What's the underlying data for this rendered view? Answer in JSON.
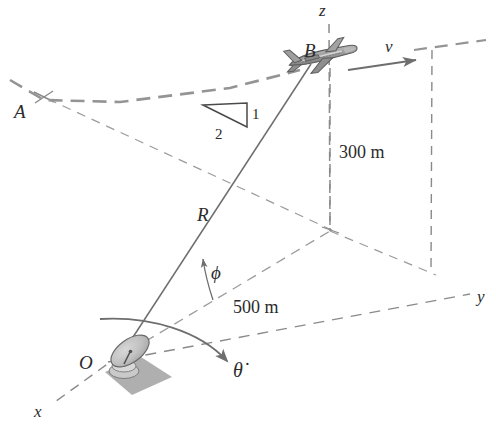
{
  "figure": {
    "kind": "engineering-kinematics-diagram",
    "background_color": "#ffffff",
    "ink_color": "#2b2b2b",
    "dash_color": "#8a8a8a",
    "solid_line_color": "#6e6e6e",
    "plane_fill": "#9a9a9a",
    "plane_stroke": "#5d5d5d",
    "dish_fill": "#bdbdbd",
    "dish_stroke": "#6a6a6a",
    "shadow_fill": "#a8a8a8"
  },
  "axes": {
    "z": {
      "label": "z",
      "x": 322,
      "y": 14
    },
    "y": {
      "label": "y",
      "x": 481,
      "y": 299
    },
    "x": {
      "label": "x",
      "x": 41,
      "y": 414
    }
  },
  "points": {
    "origin": {
      "label": "O",
      "x": 87,
      "y": 362,
      "description": "radar station at origin"
    },
    "aircraft": {
      "label": "B",
      "x": 311,
      "y": 50,
      "description": "aircraft current position"
    },
    "path_point": {
      "label": "A",
      "x": 23,
      "y": 111,
      "description": "point A on flight path"
    }
  },
  "vectors": {
    "range": {
      "label": "R",
      "x": 205,
      "y": 214,
      "description": "slant range from O to B"
    },
    "velocity": {
      "label": "v",
      "x": 391,
      "y": 48,
      "description": "aircraft velocity along flight path"
    }
  },
  "angles": {
    "elevation": {
      "label": "ϕ",
      "x": 218,
      "y": 272,
      "description": "elevation angle phi between R and horizontal"
    },
    "azimuth_rate": {
      "label": "θ̇",
      "x": 240,
      "y": 370,
      "description": "azimuth angular rate theta-dot"
    }
  },
  "dimensions": [
    {
      "id": "height",
      "label": "300 m",
      "x": 343,
      "y": 152,
      "description": "altitude of aircraft above horizontal plane"
    },
    {
      "id": "ground-range",
      "label": "500 m",
      "x": 237,
      "y": 307,
      "description": "horizontal ground distance"
    }
  ],
  "slope_triangle": {
    "rise_label": "1",
    "run_label": "2",
    "rise_pos": {
      "x": 254,
      "y": 114
    },
    "run_pos": {
      "x": 219,
      "y": 133
    },
    "description": "flight path climb slope 1 vertical to 2 horizontal"
  }
}
